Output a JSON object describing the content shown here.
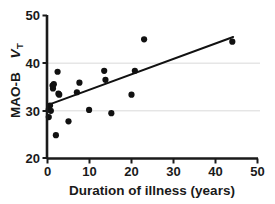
{
  "chart_data": {
    "type": "scatter",
    "title": "",
    "xlabel": "Duration of illness (years)",
    "ylabel": "MAO-B",
    "ylabel_italic": "V",
    "ylabel_subscript": "T",
    "xlim": [
      0,
      50
    ],
    "ylim": [
      20,
      50
    ],
    "xticks": [
      0,
      10,
      20,
      30,
      40,
      50
    ],
    "xtick_labels": [
      "0",
      "10",
      "20",
      "30",
      "40",
      "50"
    ],
    "yticks": [
      20,
      30,
      40,
      50
    ],
    "ytick_labels": [
      "20",
      "30",
      "40",
      "50"
    ],
    "gridlines_y": [
      30,
      40
    ],
    "grid": "horizontal-only",
    "grid_color": "#d9d9d9",
    "axis_color": "#1a1a1a",
    "marker_color": "#111111",
    "marker_size": 3.1,
    "legend": "none",
    "points": [
      {
        "x": 0.3,
        "y": 30.3
      },
      {
        "x": 0.3,
        "y": 28.7
      },
      {
        "x": 0.6,
        "y": 31.1
      },
      {
        "x": 0.8,
        "y": 30.0
      },
      {
        "x": 1.2,
        "y": 35.3
      },
      {
        "x": 1.3,
        "y": 34.7
      },
      {
        "x": 1.5,
        "y": 35.6
      },
      {
        "x": 2.0,
        "y": 24.9
      },
      {
        "x": 2.4,
        "y": 38.2
      },
      {
        "x": 2.6,
        "y": 33.6
      },
      {
        "x": 2.8,
        "y": 33.4
      },
      {
        "x": 5.0,
        "y": 27.8
      },
      {
        "x": 7.0,
        "y": 33.9
      },
      {
        "x": 7.6,
        "y": 35.9
      },
      {
        "x": 9.9,
        "y": 30.2
      },
      {
        "x": 13.5,
        "y": 38.4
      },
      {
        "x": 13.8,
        "y": 36.5
      },
      {
        "x": 15.2,
        "y": 29.5
      },
      {
        "x": 20.0,
        "y": 33.4
      },
      {
        "x": 20.8,
        "y": 38.4
      },
      {
        "x": 23.0,
        "y": 45.0
      },
      {
        "x": 44.0,
        "y": 44.5
      }
    ],
    "trendline": {
      "type": "linear-fit",
      "x_start": 0.0,
      "y_start": 31.2,
      "x_end": 44.2,
      "y_end": 45.5,
      "color": "#111111",
      "width": 2.0
    }
  }
}
